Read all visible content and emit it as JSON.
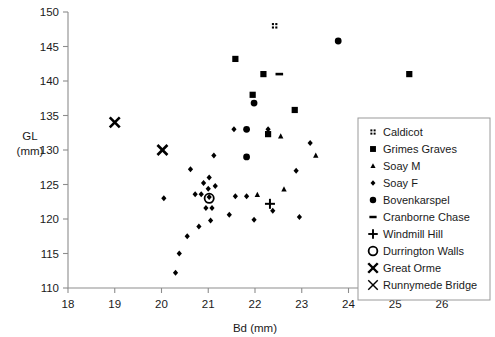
{
  "chart_data": {
    "type": "scatter",
    "title": "",
    "xlabel": "Bd (mm)",
    "ylabel": "GL\n(mm)",
    "ylabel_line1": "GL",
    "ylabel_line2": "(mm)",
    "xlim": [
      18,
      26
    ],
    "ylim": [
      110,
      150
    ],
    "xticks": [
      18,
      19,
      20,
      21,
      22,
      23,
      24,
      25,
      26
    ],
    "yticks": [
      110,
      115,
      120,
      125,
      130,
      135,
      140,
      145,
      150
    ],
    "grid": false,
    "legend_position": "right",
    "series": [
      {
        "name": "Caldicot",
        "marker": "four-squares",
        "points": [
          [
            22.42,
            148.0
          ]
        ]
      },
      {
        "name": "Grimes Graves",
        "marker": "filled-square",
        "points": [
          [
            21.58,
            143.2
          ],
          [
            22.18,
            141.0
          ],
          [
            21.95,
            138.0
          ],
          [
            22.85,
            135.8
          ],
          [
            22.28,
            132.3
          ],
          [
            25.3,
            141.0
          ]
        ]
      },
      {
        "name": "Soay M",
        "marker": "small-triangle",
        "points": [
          [
            22.55,
            132.0
          ],
          [
            23.3,
            129.2
          ],
          [
            22.62,
            124.3
          ],
          [
            22.05,
            123.5
          ]
        ]
      },
      {
        "name": "Soay F",
        "marker": "small-diamond",
        "points": [
          [
            21.55,
            133.0
          ],
          [
            22.28,
            133.0
          ],
          [
            21.12,
            129.2
          ],
          [
            20.62,
            127.2
          ],
          [
            21.02,
            126.0
          ],
          [
            20.9,
            125.2
          ],
          [
            21.0,
            124.4
          ],
          [
            20.72,
            123.6
          ],
          [
            20.85,
            123.6
          ],
          [
            21.02,
            123.2
          ],
          [
            21.58,
            123.3
          ],
          [
            21.82,
            123.3
          ],
          [
            20.95,
            121.6
          ],
          [
            21.08,
            121.6
          ],
          [
            21.15,
            124.8
          ],
          [
            21.45,
            120.6
          ],
          [
            21.05,
            119.8
          ],
          [
            20.8,
            118.9
          ],
          [
            20.55,
            117.5
          ],
          [
            20.38,
            115.0
          ],
          [
            20.3,
            112.2
          ],
          [
            22.38,
            121.2
          ],
          [
            22.95,
            120.3
          ],
          [
            23.18,
            131.0
          ],
          [
            22.88,
            127.0
          ],
          [
            21.98,
            119.9
          ],
          [
            20.05,
            123.0
          ]
        ]
      },
      {
        "name": "Bovenkarspel",
        "marker": "filled-circle",
        "points": [
          [
            21.98,
            136.8
          ],
          [
            21.82,
            133.0
          ],
          [
            21.82,
            129.0
          ],
          [
            23.78,
            145.8
          ]
        ]
      },
      {
        "name": "Cranborne Chase",
        "marker": "dash",
        "points": [
          [
            22.52,
            141.0
          ]
        ]
      },
      {
        "name": "Windmill Hill",
        "marker": "plus",
        "points": [
          [
            22.32,
            122.2
          ]
        ]
      },
      {
        "name": "Durrington Walls",
        "marker": "open-circle",
        "points": [
          [
            21.02,
            123.0
          ]
        ]
      },
      {
        "name": "Great Orme",
        "marker": "bold-x",
        "points": [
          [
            19.0,
            134.0
          ],
          [
            20.02,
            130.0
          ]
        ]
      },
      {
        "name": "Runnymede Bridge",
        "marker": "thin-x",
        "points": []
      }
    ]
  },
  "legend": {
    "items": [
      {
        "label": "Caldicot",
        "marker": "four-squares"
      },
      {
        "label": "Grimes Graves",
        "marker": "filled-square"
      },
      {
        "label": "Soay M",
        "marker": "small-triangle"
      },
      {
        "label": "Soay F",
        "marker": "small-diamond"
      },
      {
        "label": "Bovenkarspel",
        "marker": "filled-circle"
      },
      {
        "label": "Cranborne Chase",
        "marker": "dash"
      },
      {
        "label": "Windmill Hill",
        "marker": "plus"
      },
      {
        "label": "Durrington Walls",
        "marker": "open-circle"
      },
      {
        "label": "Great Orme",
        "marker": "bold-x"
      },
      {
        "label": "Runnymede Bridge",
        "marker": "thin-x"
      }
    ]
  },
  "colors": {
    "marker": "#000000",
    "axis": "#8d8d8d",
    "text": "#1a1a1a",
    "background": "#ffffff",
    "legend_border": "#9a9a9a"
  }
}
